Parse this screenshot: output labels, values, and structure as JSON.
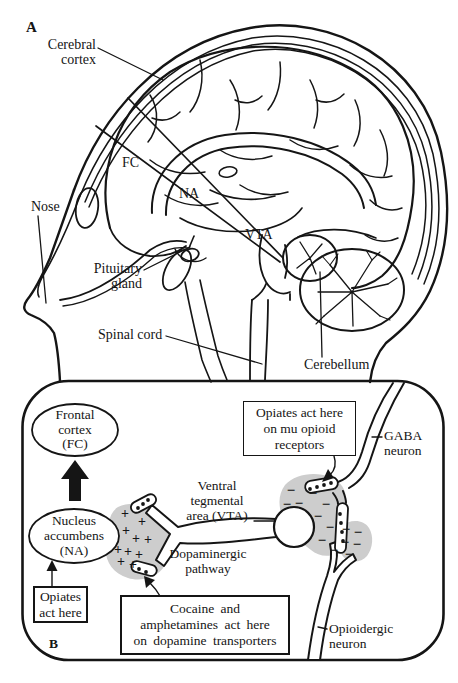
{
  "figure_type": "brain reward pathway diagram",
  "colors": {
    "ink": "#151515",
    "shade": "#cdcdcd",
    "background": "#ffffff"
  },
  "panel_a": {
    "panel_label": "A",
    "labels": {
      "cerebral_cortex": "Cerebral\ncortex",
      "nose": "Nose",
      "fc": "FC",
      "na": "NA",
      "vta": "VTA",
      "pituitary_gland": "Pituitary\ngland",
      "spinal_cord": "Spinal cord",
      "cerebellum": "Cerebellum"
    }
  },
  "panel_b": {
    "panel_label": "B",
    "nodes": {
      "frontal_cortex": "Frontal\ncortex\n(FC)",
      "nucleus_accumbens": "Nucleus\naccumbens\n(NA)",
      "ventral_tegmental_area": "Ventral\ntegmental\narea (VTA)",
      "dopaminergic_pathway": "Dopaminergic\npathway",
      "gaba_neuron": "GABA\nneuron",
      "opioidergic_neuron": "Opioidergic\nneuron"
    },
    "callouts": {
      "opiates_na": "Opiates\nact here",
      "opiates_mu": "Opiates act here\non mu opioid\nreceptors",
      "cocaine": "Cocaine and\namphetamines act here\non dopamine transporters"
    },
    "markers": {
      "plus_glyph": "+",
      "minus_glyph": "−",
      "plus_positions": [
        [
          125,
          513
        ],
        [
          142,
          521
        ],
        [
          126,
          530
        ],
        [
          136,
          538
        ],
        [
          148,
          539
        ],
        [
          118,
          549
        ],
        [
          128,
          551
        ],
        [
          139,
          554
        ],
        [
          121,
          561
        ],
        [
          133,
          564
        ]
      ],
      "minus_positions": [
        [
          291,
          491
        ],
        [
          313,
          494
        ],
        [
          299,
          504
        ],
        [
          326,
          505
        ],
        [
          287,
          505
        ],
        [
          318,
          517
        ],
        [
          330,
          528
        ],
        [
          322,
          541
        ],
        [
          334,
          551
        ],
        [
          346,
          530
        ],
        [
          358,
          533
        ],
        [
          345,
          543
        ],
        [
          357,
          545
        ],
        [
          349,
          555
        ]
      ],
      "vesicle_dots": [
        [
          138,
          508
        ],
        [
          143,
          504
        ],
        [
          148,
          500
        ],
        [
          139,
          569
        ],
        [
          146,
          572
        ],
        [
          310,
          489
        ],
        [
          317,
          487
        ],
        [
          324,
          485
        ],
        [
          331,
          483
        ],
        [
          340,
          514
        ],
        [
          341,
          523
        ],
        [
          342,
          532
        ],
        [
          343,
          541
        ]
      ]
    }
  }
}
